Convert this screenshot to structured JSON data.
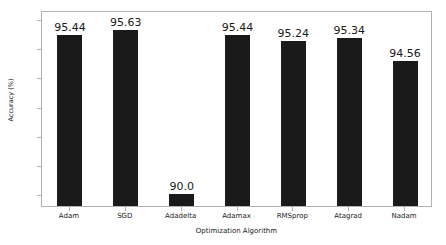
{
  "chart_data": {
    "type": "bar",
    "title": "",
    "xlabel": "Optimization Algorithm",
    "ylabel": "Accuracy (%)",
    "categories": [
      "Adam",
      "SGD",
      "Adadelta",
      "Adamax",
      "RMSprop",
      "Atagrad",
      "Nadam"
    ],
    "values": [
      95.44,
      95.63,
      90.0,
      95.44,
      95.24,
      95.34,
      94.56
    ],
    "value_labels": [
      "95.44",
      "95.63",
      "90.0",
      "95.44",
      "95.24",
      "95.34",
      "94.56"
    ],
    "ylim": [
      89.6,
      96.3
    ],
    "yticks": [
      90,
      91,
      92,
      93,
      94,
      95,
      96
    ],
    "ytick_labels": [
      "90",
      "91",
      "92",
      "93",
      "94",
      "95",
      "96"
    ],
    "grid": false,
    "legend": null,
    "bar_color": "#1a1a1a",
    "frame_color": "#b0b0b0",
    "background": "#ffffff"
  }
}
